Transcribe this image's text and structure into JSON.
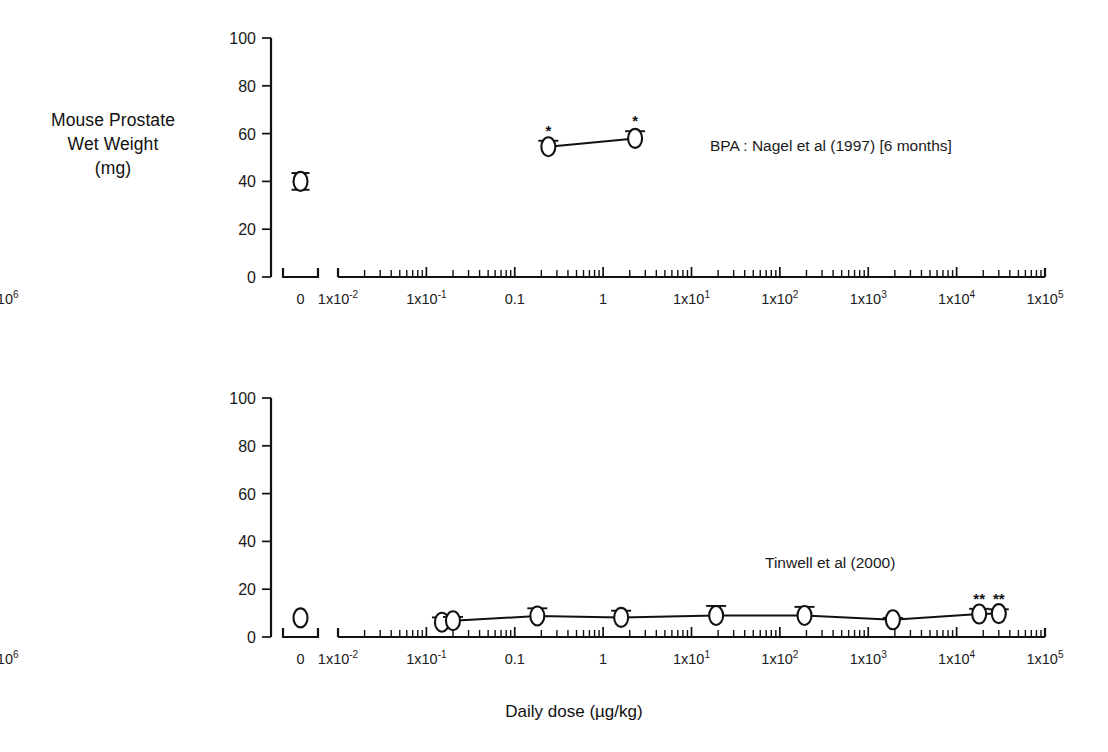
{
  "figure": {
    "xaxis_title": "Daily dose (µg/kg)",
    "background": "#ffffff",
    "ink_color": "#111111"
  },
  "panels": {
    "top": {
      "ylabel": "Mouse Prostate\nWet Weight\n(mg)",
      "annotation": "BPA : Nagel et al (1997) [6 months]",
      "star_marks": [
        "*",
        "*"
      ]
    },
    "bottom": {
      "ylabel": "Mouse Uterine\nBlotted Weight\n(mg)",
      "annotation": "Tinwell et al (2000)",
      "star_marks": [
        "**",
        "**"
      ]
    }
  },
  "axis": {
    "y_ticks": [
      "0",
      "20",
      "40",
      "60",
      "80",
      "100"
    ],
    "y_values": [
      0,
      20,
      40,
      60,
      80,
      100
    ],
    "ylim": [
      0,
      100
    ],
    "x_tick_labels": [
      {
        "base": "0",
        "sup": ""
      },
      {
        "base": "1x10",
        "sup": "-2"
      },
      {
        "base": "1x10",
        "sup": "-1"
      },
      {
        "base": "0.1",
        "sup": ""
      },
      {
        "base": "1",
        "sup": ""
      },
      {
        "base": "1x10",
        "sup": "1"
      },
      {
        "base": "1x10",
        "sup": "2"
      },
      {
        "base": "1x10",
        "sup": "3"
      },
      {
        "base": "1x10",
        "sup": "4"
      },
      {
        "base": "1x10",
        "sup": "5"
      },
      {
        "base": "1x10",
        "sup": "6"
      }
    ],
    "x_log_decades": [
      -2,
      -1,
      0,
      1,
      2,
      3,
      4,
      5,
      6
    ],
    "xlim_log": [
      -2,
      6
    ],
    "grid": false,
    "legend_position": "inline-right-of-series"
  },
  "chart_data": [
    {
      "type": "line",
      "title": "Mouse Prostate Wet Weight (mg)",
      "subtitle": "BPA : Nagel et al (1997) [6 months]",
      "xlabel": "Daily dose (µg/kg)",
      "ylabel": "Mouse Prostate Wet Weight (mg)",
      "ylim": [
        0,
        100
      ],
      "xscale": "log",
      "xlim": [
        0.01,
        1000000
      ],
      "grid": false,
      "control": {
        "x_label": "0",
        "y": 40,
        "err_up": 3.5,
        "err_dn": 3.5
      },
      "series": [
        {
          "name": "BPA : Nagel et al (1997) [6 months]",
          "x": [
            2.4,
            23
          ],
          "y": [
            54.5,
            58
          ],
          "err_up": [
            2.5,
            3.0
          ],
          "err_dn": [
            0,
            0
          ],
          "significance": [
            "*",
            "*"
          ]
        }
      ]
    },
    {
      "type": "line",
      "title": "Mouse Uterine Blotted Weight (mg)",
      "subtitle": "Tinwell et al (2000)",
      "xlabel": "Daily dose (µg/kg)",
      "ylabel": "Mouse Uterine Blotted Weight (mg)",
      "ylim": [
        0,
        100
      ],
      "xscale": "log",
      "xlim": [
        0.01,
        1000000
      ],
      "grid": false,
      "control": {
        "x_label": "0",
        "y": 8,
        "err_up": 0,
        "err_dn": 0
      },
      "series": [
        {
          "name": "Tinwell et al (2000)",
          "x": [
            0.15,
            0.2,
            1.8,
            16,
            190,
            1900,
            19000,
            180000,
            300000
          ],
          "y": [
            6.2,
            6.8,
            8.8,
            8.2,
            9.0,
            9.0,
            7.2,
            9.6,
            9.8
          ],
          "err_up": [
            2.0,
            1.6,
            3.2,
            2.8,
            4.0,
            3.6,
            0.8,
            2.2,
            1.8
          ],
          "err_dn": [
            0,
            0,
            0,
            0,
            0,
            0,
            0,
            0,
            0
          ],
          "significance": [
            "",
            "",
            "",
            "",
            "",
            "",
            "",
            "**",
            "**"
          ]
        }
      ]
    }
  ]
}
